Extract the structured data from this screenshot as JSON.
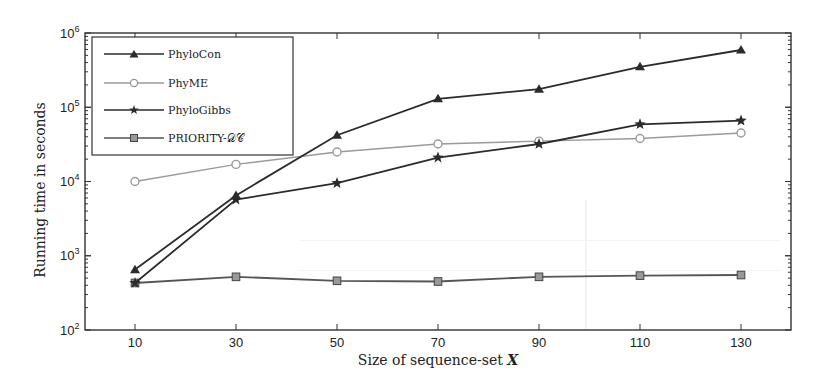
{
  "chart_data": {
    "type": "line",
    "title": "",
    "xlabel": "Size of sequence-set X",
    "ylabel": "Running time in seconds",
    "yscale": "log",
    "ylim": [
      100,
      1000000
    ],
    "xlim": [
      0,
      140
    ],
    "x": [
      10,
      30,
      50,
      70,
      90,
      110,
      130
    ],
    "xticks": [
      "10",
      "30",
      "50",
      "70",
      "90",
      "110",
      "130"
    ],
    "yticks": [
      "10^2",
      "10^3",
      "10^4",
      "10^5",
      "10^6"
    ],
    "grid": false,
    "legend_position": "upper left",
    "series": [
      {
        "name": "PhyloCon",
        "marker": "triangle",
        "color": "#2b2b2b",
        "values": [
          650,
          6500,
          42000,
          130000,
          175000,
          350000,
          590000
        ]
      },
      {
        "name": "PhyME",
        "marker": "circle",
        "color": "#9a9a9a",
        "values": [
          10000,
          17000,
          25000,
          32000,
          35000,
          38000,
          45000
        ]
      },
      {
        "name": "PhyloGibbs",
        "marker": "star",
        "color": "#2b2b2b",
        "values": [
          430,
          5700,
          9500,
          21000,
          32000,
          59000,
          66000
        ]
      },
      {
        "name": "PRIORITY-DC",
        "marker": "square",
        "color": "#555555",
        "values": [
          430,
          520,
          460,
          450,
          520,
          540,
          550
        ]
      }
    ]
  },
  "axes": {
    "xlabel_main": "Size of sequence-set ",
    "xlabel_var": "X",
    "ylabel": "Running time in seconds",
    "yticks": [
      {
        "base": "10",
        "exp": "2"
      },
      {
        "base": "10",
        "exp": "3"
      },
      {
        "base": "10",
        "exp": "4"
      },
      {
        "base": "10",
        "exp": "5"
      },
      {
        "base": "10",
        "exp": "6"
      }
    ],
    "xticks": [
      "10",
      "30",
      "50",
      "70",
      "90",
      "110",
      "130"
    ]
  },
  "legend": {
    "items": [
      {
        "label": "PhyloCon"
      },
      {
        "label": "PhyME"
      },
      {
        "label": "PhyloGibbs"
      },
      {
        "label": "PRIORITY-𝒟𝒞"
      }
    ]
  }
}
